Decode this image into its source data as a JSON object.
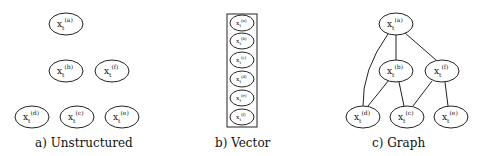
{
  "panels": {
    "unstructured": {
      "caption": "a) Unstructured",
      "nodes": [
        {
          "id": "a",
          "base": "x",
          "sub": "t",
          "sup": "(a)"
        },
        {
          "id": "b",
          "base": "x",
          "sub": "t",
          "sup": "(b)"
        },
        {
          "id": "f",
          "base": "x",
          "sub": "t",
          "sup": "(f)"
        },
        {
          "id": "d",
          "base": "x",
          "sub": "t",
          "sup": "(d)"
        },
        {
          "id": "c",
          "base": "x",
          "sub": "t",
          "sup": "(c)"
        },
        {
          "id": "e",
          "base": "x",
          "sub": "t",
          "sup": "(e)"
        }
      ]
    },
    "vector": {
      "caption": "b) Vector",
      "nodes": [
        {
          "id": "a",
          "base": "x",
          "sub": "t",
          "sup": "(a)"
        },
        {
          "id": "b",
          "base": "x",
          "sub": "t",
          "sup": "(b)"
        },
        {
          "id": "c",
          "base": "x",
          "sub": "t",
          "sup": "(c)"
        },
        {
          "id": "d",
          "base": "x",
          "sub": "t",
          "sup": "(d)"
        },
        {
          "id": "e",
          "base": "x",
          "sub": "t",
          "sup": "(e)"
        },
        {
          "id": "f",
          "base": "x",
          "sub": "t",
          "sup": "(f)"
        }
      ]
    },
    "graph": {
      "caption": "c) Graph",
      "nodes": [
        {
          "id": "a",
          "base": "x",
          "sub": "t",
          "sup": "(a)"
        },
        {
          "id": "b",
          "base": "x",
          "sub": "t",
          "sup": "(b)"
        },
        {
          "id": "f",
          "base": "x",
          "sub": "t",
          "sup": "(f)"
        },
        {
          "id": "d",
          "base": "x",
          "sub": "t",
          "sup": "(d)"
        },
        {
          "id": "c",
          "base": "x",
          "sub": "t",
          "sup": "(c)"
        },
        {
          "id": "e",
          "base": "x",
          "sub": "t",
          "sup": "(e)"
        }
      ],
      "edges": [
        [
          "a",
          "b"
        ],
        [
          "a",
          "f"
        ],
        [
          "a",
          "d"
        ],
        [
          "b",
          "d"
        ],
        [
          "b",
          "c"
        ],
        [
          "f",
          "c"
        ],
        [
          "f",
          "e"
        ]
      ]
    }
  }
}
